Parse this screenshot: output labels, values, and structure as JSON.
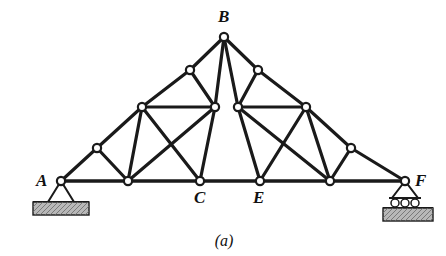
{
  "figure": {
    "caption": "(a)",
    "caption_x": 224,
    "caption_y": 246,
    "type": "fink-roof-truss",
    "width": 446,
    "height": 256,
    "line_color": "#1a1a1a",
    "ground_fill": "#b8b8b8",
    "background": "#ffffff"
  },
  "labels": [
    {
      "text": "A",
      "x": 36,
      "y": 186,
      "name": "node-label-a"
    },
    {
      "text": "B",
      "x": 218,
      "y": 22,
      "name": "node-label-b"
    },
    {
      "text": "C",
      "x": 194,
      "y": 203,
      "name": "node-label-c"
    },
    {
      "text": "E",
      "x": 253,
      "y": 203,
      "name": "node-label-e"
    },
    {
      "text": "F",
      "x": 415,
      "y": 186,
      "name": "node-label-f"
    }
  ],
  "joints": [
    {
      "id": "A",
      "x": 61,
      "y": 181,
      "labeled": true
    },
    {
      "id": "L1",
      "x": 97,
      "y": 148,
      "labeled": false
    },
    {
      "id": "L2",
      "x": 142,
      "y": 107,
      "labeled": false
    },
    {
      "id": "L3",
      "x": 190,
      "y": 70,
      "labeled": false
    },
    {
      "id": "B",
      "x": 224,
      "y": 37,
      "labeled": true
    },
    {
      "id": "R3",
      "x": 258,
      "y": 70,
      "labeled": false
    },
    {
      "id": "R2",
      "x": 306,
      "y": 107,
      "labeled": false
    },
    {
      "id": "R1",
      "x": 351,
      "y": 148,
      "labeled": false
    },
    {
      "id": "F",
      "x": 405,
      "y": 181,
      "labeled": true
    },
    {
      "id": "LM",
      "x": 215,
      "y": 107,
      "labeled": false
    },
    {
      "id": "RM",
      "x": 238,
      "y": 107,
      "labeled": false
    },
    {
      "id": "D1",
      "x": 128,
      "y": 181,
      "labeled": false
    },
    {
      "id": "C",
      "x": 200,
      "y": 181,
      "labeled": true
    },
    {
      "id": "E",
      "x": 260,
      "y": 181,
      "labeled": true
    },
    {
      "id": "D2",
      "x": 330,
      "y": 181,
      "labeled": false
    }
  ],
  "members": [
    {
      "from": "A",
      "to": "L1",
      "kind": "top-chord"
    },
    {
      "from": "L1",
      "to": "L2",
      "kind": "top-chord"
    },
    {
      "from": "L2",
      "to": "L3",
      "kind": "top-chord"
    },
    {
      "from": "L3",
      "to": "B",
      "kind": "top-chord"
    },
    {
      "from": "B",
      "to": "R3",
      "kind": "top-chord"
    },
    {
      "from": "R3",
      "to": "R2",
      "kind": "top-chord"
    },
    {
      "from": "R2",
      "to": "R1",
      "kind": "top-chord"
    },
    {
      "from": "R1",
      "to": "F",
      "kind": "top-chord"
    },
    {
      "from": "A",
      "to": "D1",
      "kind": "bottom-chord"
    },
    {
      "from": "D1",
      "to": "C",
      "kind": "bottom-chord"
    },
    {
      "from": "C",
      "to": "E",
      "kind": "bottom-chord"
    },
    {
      "from": "E",
      "to": "D2",
      "kind": "bottom-chord"
    },
    {
      "from": "D2",
      "to": "F",
      "kind": "bottom-chord"
    },
    {
      "from": "L2",
      "to": "LM",
      "kind": "inner-chord"
    },
    {
      "from": "RM",
      "to": "R2",
      "kind": "inner-chord"
    },
    {
      "from": "L1",
      "to": "D1",
      "kind": "web"
    },
    {
      "from": "L2",
      "to": "D1",
      "kind": "web"
    },
    {
      "from": "D1",
      "to": "LM",
      "kind": "web"
    },
    {
      "from": "L3",
      "to": "LM",
      "kind": "web"
    },
    {
      "from": "LM",
      "to": "C",
      "kind": "web"
    },
    {
      "from": "B",
      "to": "LM",
      "kind": "web"
    },
    {
      "from": "B",
      "to": "RM",
      "kind": "web"
    },
    {
      "from": "RM",
      "to": "E",
      "kind": "web"
    },
    {
      "from": "R3",
      "to": "RM",
      "kind": "web"
    },
    {
      "from": "RM",
      "to": "D2",
      "kind": "web"
    },
    {
      "from": "R2",
      "to": "D2",
      "kind": "web"
    },
    {
      "from": "R1",
      "to": "D2",
      "kind": "web"
    },
    {
      "from": "L2",
      "to": "C",
      "kind": "web"
    },
    {
      "from": "R2",
      "to": "E",
      "kind": "web"
    }
  ],
  "supports": {
    "pin": {
      "name": "pin-support",
      "joint": "A",
      "apex_x": 61,
      "apex_y": 181,
      "base_y": 202,
      "half_width": 13,
      "ground_x": 33,
      "ground_y": 202,
      "ground_w": 56,
      "ground_h": 13,
      "type_label": "pin"
    },
    "roller": {
      "name": "roller-support",
      "joint": "F",
      "apex_x": 405,
      "apex_y": 181,
      "base_y": 198,
      "half_width": 13,
      "rollers": [
        {
          "cx": 395,
          "cy": 203
        },
        {
          "cx": 405,
          "cy": 203
        },
        {
          "cx": 415,
          "cy": 203
        }
      ],
      "roller_r": 4,
      "ground_x": 383,
      "ground_y": 208,
      "ground_w": 50,
      "ground_h": 13,
      "type_label": "roller"
    }
  }
}
